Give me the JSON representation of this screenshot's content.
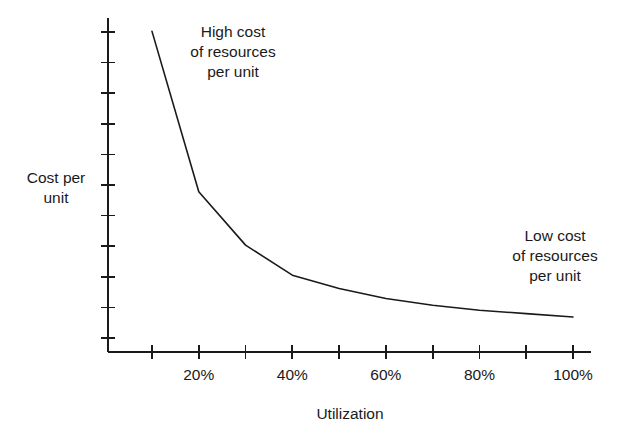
{
  "chart_data": {
    "type": "line",
    "title": "",
    "subtitle": "",
    "xlabel": "Utilization",
    "ylabel": "Cost per\nunit",
    "xlim": [
      0,
      105
    ],
    "ylim": [
      0,
      100
    ],
    "grid": false,
    "legend_position": "none",
    "x_tick_values": [
      10,
      20,
      30,
      40,
      50,
      60,
      70,
      80,
      90,
      100
    ],
    "x_tick_labels": [
      "",
      "20%",
      "",
      "40%",
      "",
      "60%",
      "",
      "80%",
      "",
      "100%"
    ],
    "x_labeled_ticks": [
      {
        "value": 20,
        "label": "20%"
      },
      {
        "value": 40,
        "label": "40%"
      },
      {
        "value": 60,
        "label": "60%"
      },
      {
        "value": 80,
        "label": "80%"
      },
      {
        "value": 100,
        "label": "100%"
      }
    ],
    "y_tick_count": 11,
    "y_tick_labels": [],
    "series": [
      {
        "name": "Cost per unit",
        "x": [
          10,
          20,
          30,
          40,
          50,
          60,
          70,
          80,
          90,
          100
        ],
        "y": [
          96,
          48,
          32,
          23,
          19,
          16,
          14,
          12.5,
          11.5,
          10.5
        ],
        "color": "#1a1a1a",
        "line_width": 1.6
      }
    ],
    "annotations": [
      {
        "name": "high-cost-note",
        "text": "High cost\nof resources\nper unit",
        "x": 21,
        "y": 88
      },
      {
        "name": "low-cost-note",
        "text": "Low cost\nof resources\nper unit",
        "x": 89,
        "y": 36
      }
    ]
  },
  "axes": {
    "y_label": "Cost per\nunit",
    "x_label": "Utilization"
  },
  "annotations": {
    "high_cost": "High cost\nof resources\nper unit",
    "low_cost": "Low cost\nof resources\nper unit"
  },
  "colors": {
    "line": "#1a1a1a",
    "axis": "#1a1a1a",
    "background": "#ffffff",
    "text": "#1a1a1a"
  }
}
